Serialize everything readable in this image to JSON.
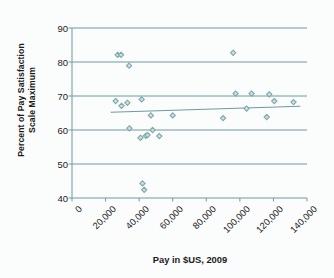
{
  "chart_data": {
    "type": "scatter",
    "title": "",
    "xlabel": "Pay in $US, 2009",
    "ylabel_line1": "Percent of Pay Satisfaction",
    "ylabel_line2": "Scale Maximum",
    "ylabel": "Percent of Pay Satisfaction Scale Maximum",
    "xlim": [
      0,
      140000
    ],
    "ylim": [
      40,
      90
    ],
    "xticks": [
      0,
      20000,
      40000,
      60000,
      80000,
      100000,
      120000,
      140000
    ],
    "xtick_labels": [
      "0",
      "20,000",
      "40,000",
      "60,000",
      "80,000",
      "100,000",
      "120,000",
      "140,000"
    ],
    "yticks": [
      40,
      50,
      60,
      70,
      80,
      90
    ],
    "ytick_labels": [
      "40",
      "50",
      "60",
      "70",
      "80",
      "90"
    ],
    "grid": "horizontal",
    "legend": "none",
    "marker": "diamond",
    "marker_color": "#7fa8ac",
    "grid_color": "#6f9aa0",
    "axis_color": "#6f9aa0",
    "trendline": {
      "visible": true,
      "color": "#6f9aa0",
      "x_start": 23000,
      "y_start": 65.2,
      "x_end": 136000,
      "y_end": 67.0
    },
    "points": [
      {
        "x": 26000,
        "y": 68.5
      },
      {
        "x": 27200,
        "y": 82.1
      },
      {
        "x": 29200,
        "y": 82.1
      },
      {
        "x": 29500,
        "y": 67.1
      },
      {
        "x": 33000,
        "y": 68.0
      },
      {
        "x": 34000,
        "y": 78.9
      },
      {
        "x": 34200,
        "y": 60.5
      },
      {
        "x": 40800,
        "y": 57.7
      },
      {
        "x": 41500,
        "y": 69.0
      },
      {
        "x": 42000,
        "y": 44.3
      },
      {
        "x": 43000,
        "y": 42.4
      },
      {
        "x": 44000,
        "y": 58.3
      },
      {
        "x": 45000,
        "y": 58.5
      },
      {
        "x": 47000,
        "y": 64.3
      },
      {
        "x": 48000,
        "y": 60.0
      },
      {
        "x": 52000,
        "y": 58.2
      },
      {
        "x": 60000,
        "y": 64.3
      },
      {
        "x": 90000,
        "y": 63.5
      },
      {
        "x": 96000,
        "y": 82.7
      },
      {
        "x": 97500,
        "y": 70.7
      },
      {
        "x": 104000,
        "y": 66.3
      },
      {
        "x": 107000,
        "y": 70.7
      },
      {
        "x": 116000,
        "y": 63.8
      },
      {
        "x": 117500,
        "y": 70.5
      },
      {
        "x": 120500,
        "y": 68.5
      },
      {
        "x": 132000,
        "y": 68.2
      }
    ]
  }
}
